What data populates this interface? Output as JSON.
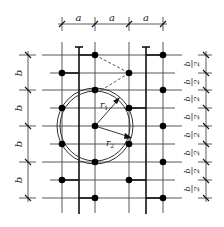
{
  "diagram": {
    "top_dimension": {
      "labels": [
        "a",
        "a",
        "a"
      ],
      "ticks_x": [
        62,
        95,
        129,
        163
      ],
      "y": 24
    },
    "left_dimension": {
      "labels": [
        "b",
        "b",
        "b",
        "b"
      ],
      "ticks_y": [
        55,
        90,
        126,
        162,
        198
      ],
      "x": 28
    },
    "right_dimension": {
      "labels": [
        "b/2",
        "b/2",
        "b/2",
        "b/2",
        "b/2",
        "b/2",
        "b/2",
        "b/2"
      ],
      "label_num": "b",
      "label_den": "2",
      "ticks_y": [
        55,
        73,
        90,
        108,
        126,
        144,
        162,
        180,
        198
      ],
      "x": 206
    },
    "circle": {
      "center": [
        95,
        126
      ],
      "inner_label": "r1",
      "outer_label": "r2",
      "r1_text": "r",
      "r1_sub": "1",
      "r2_text": "r",
      "r2_sub": "2",
      "r1": 35,
      "r2": 38
    },
    "grid": {
      "full_rows_y": [
        55,
        90,
        126,
        162,
        198
      ],
      "half_rows_y": [
        73,
        108,
        144,
        180
      ],
      "columns_x": [
        62,
        95,
        129,
        163
      ],
      "bold_columns_x": [
        79,
        146
      ]
    },
    "points": {
      "column_a": {
        "x": 62,
        "y": [
          73,
          108,
          144,
          180
        ]
      },
      "column_b": {
        "x": 95,
        "y": [
          55,
          90,
          126,
          162,
          198
        ]
      },
      "column_c": {
        "x": 129,
        "y": [
          73,
          108,
          144,
          180
        ]
      },
      "column_d": {
        "x": 163,
        "y": [
          55,
          90,
          126,
          162,
          198
        ]
      }
    }
  }
}
